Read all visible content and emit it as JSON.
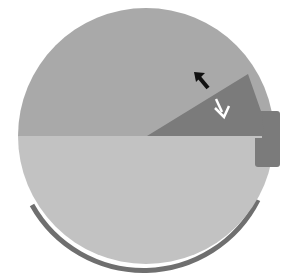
{
  "diagram": {
    "type": "circle-with-wedge",
    "colors": {
      "background": "#ffffff",
      "upper_half": "#a9a9a9",
      "lower_half": "#c2c2c2",
      "wedge": "#7b7b7b",
      "tab": "#7b7b7b",
      "rim_arc": "#6f6f6f",
      "arrow_dark": "#111111",
      "arrow_light": "#ffffff"
    },
    "elements": {
      "upper_half": "upper semicircle",
      "lower_half": "lower semicircle",
      "wedge": "dark wedge sector",
      "tab": "side tab",
      "rim_arc": "bottom rim arc",
      "arrow_up": "arrow pointing up-left",
      "arrow_down": "arrow pointing down-right"
    }
  }
}
